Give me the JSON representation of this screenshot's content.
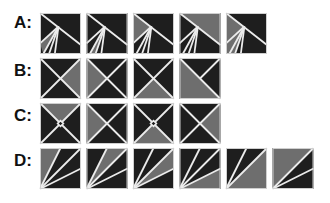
{
  "colors": {
    "dark": "#1e1e1e",
    "gray": "#6e6e6e",
    "line": "#ececec",
    "background": "#ffffff"
  },
  "layout": {
    "box_size": 41,
    "box_step_x": 46.5
  },
  "rows": [
    {
      "label": "A:",
      "label_y": 14,
      "y": 13,
      "x0": 40,
      "tiles": [
        {
          "gray": [
            [
              45,
              33
            ],
            [
              0,
              74
            ],
            [
              8,
              100
            ]
          ]
        },
        {
          "gray": [
            [
              45,
              33
            ],
            [
              8,
              100
            ],
            [
              22,
              100
            ]
          ]
        },
        {
          "gray": [
            [
              0,
              0
            ],
            [
              45,
              33
            ],
            [
              0,
              74
            ]
          ]
        },
        {
          "gray": [
            [
              0,
              0
            ],
            [
              100,
              0
            ],
            [
              100,
              78
            ]
          ]
        },
        {
          "gray": [
            [
              0,
              0
            ],
            [
              45,
              33
            ],
            [
              22,
              100
            ],
            [
              0,
              100
            ]
          ]
        }
      ],
      "lines": [
        [
          [
            0,
            0
          ],
          [
            100,
            78
          ]
        ],
        [
          [
            45,
            33
          ],
          [
            0,
            74
          ]
        ],
        [
          [
            45,
            33
          ],
          [
            8,
            100
          ]
        ],
        [
          [
            45,
            33
          ],
          [
            22,
            100
          ]
        ],
        [
          [
            45,
            33
          ],
          [
            36,
            100
          ]
        ]
      ]
    },
    {
      "label": "B:",
      "label_y": 62,
      "y": 58,
      "x0": 40,
      "tiles": [
        {
          "gray": [
            [
              100,
              0
            ],
            [
              50,
              50
            ],
            [
              100,
              100
            ]
          ]
        },
        {
          "gray": [
            [
              0,
              0
            ],
            [
              50,
              50
            ],
            [
              0,
              100
            ]
          ]
        },
        {
          "gray": [
            [
              0,
              100
            ],
            [
              50,
              50
            ],
            [
              100,
              100
            ]
          ]
        },
        {
          "gray": [
            [
              0,
              0
            ],
            [
              100,
              100
            ],
            [
              0,
              100
            ]
          ],
          "variant": "half"
        }
      ],
      "lines": [
        [
          [
            0,
            0
          ],
          [
            100,
            100
          ]
        ],
        [
          [
            100,
            0
          ],
          [
            0,
            100
          ]
        ]
      ]
    },
    {
      "label": "C:",
      "label_y": 107,
      "y": 103,
      "x0": 40,
      "tiles": [
        {
          "gray": [
            [
              0,
              0
            ],
            [
              100,
              0
            ],
            [
              50,
              50
            ]
          ],
          "diamond": true
        },
        {
          "gray": [
            [
              0,
              0
            ],
            [
              50,
              50
            ],
            [
              0,
              100
            ]
          ],
          "diamond": false
        },
        {
          "gray": [
            [
              0,
              100
            ],
            [
              50,
              50
            ],
            [
              100,
              100
            ]
          ],
          "diamond": true
        },
        {
          "gray": [
            [
              100,
              0
            ],
            [
              50,
              50
            ],
            [
              100,
              100
            ]
          ],
          "diamond": false
        }
      ],
      "lines": [
        [
          [
            0,
            0
          ],
          [
            100,
            100
          ]
        ],
        [
          [
            100,
            0
          ],
          [
            0,
            100
          ]
        ]
      ]
    },
    {
      "label": "D:",
      "label_y": 152,
      "y": 148,
      "x0": 40,
      "tiles": [
        {
          "gray": [
            [
              0,
              100
            ],
            [
              0,
              0
            ],
            [
              50,
              0
            ]
          ],
          "rays": [
            [
              50,
              0
            ],
            [
              100,
              0
            ],
            [
              100,
              50
            ]
          ]
        },
        {
          "gray": [
            [
              0,
              100
            ],
            [
              50,
              0
            ],
            [
              100,
              0
            ]
          ],
          "rays": [
            [
              50,
              0
            ],
            [
              100,
              0
            ],
            [
              100,
              50
            ]
          ]
        },
        {
          "gray": [
            [
              0,
              100
            ],
            [
              100,
              0
            ],
            [
              100,
              50
            ]
          ],
          "rays": [
            [
              50,
              0
            ],
            [
              100,
              0
            ],
            [
              100,
              50
            ]
          ]
        },
        {
          "gray": [
            [
              0,
              100
            ],
            [
              100,
              50
            ],
            [
              100,
              100
            ]
          ],
          "rays": [
            [
              50,
              0
            ],
            [
              100,
              0
            ],
            [
              100,
              50
            ]
          ]
        },
        {
          "gray": [
            [
              0,
              100
            ],
            [
              100,
              0
            ],
            [
              100,
              100
            ]
          ],
          "rays": [
            [
              50,
              0
            ],
            [
              100,
              0
            ]
          ]
        },
        {
          "gray": [
            [
              0,
              100
            ],
            [
              0,
              0
            ],
            [
              100,
              0
            ]
          ],
          "rays": [
            [
              100,
              0
            ],
            [
              100,
              50
            ]
          ]
        }
      ]
    }
  ]
}
